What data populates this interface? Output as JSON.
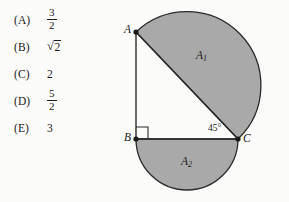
{
  "background_color": "#fbfbfa",
  "ink_color": "#1a1a1a",
  "shade_color": "#a9a9a9",
  "choices": [
    {
      "tag": "(A)",
      "kind": "fraction",
      "numerator": "3",
      "denominator": "2",
      "text": "3/2"
    },
    {
      "tag": "(B)",
      "kind": "radical",
      "radicand": "2",
      "text": "√2"
    },
    {
      "tag": "(C)",
      "kind": "plain",
      "value": "2",
      "text": "2"
    },
    {
      "tag": "(D)",
      "kind": "fraction",
      "numerator": "5",
      "denominator": "2",
      "text": "5/2"
    },
    {
      "tag": "(E)",
      "kind": "plain",
      "value": "3",
      "text": "3"
    }
  ],
  "figure": {
    "vertices": [
      {
        "name": "A",
        "label": "A",
        "x": 32,
        "y": 32
      },
      {
        "name": "B",
        "label": "B",
        "x": 32,
        "y": 139
      },
      {
        "name": "C",
        "label": "C",
        "x": 134,
        "y": 139
      }
    ],
    "regions": [
      {
        "name": "A1",
        "label": "A",
        "subscript": "1",
        "description": "semicircle on hypotenuse AC",
        "label_x": 92,
        "label_y": 49
      },
      {
        "name": "A2",
        "label": "A",
        "subscript": "2",
        "description": "semicircle on leg BC",
        "label_x": 77,
        "label_y": 155
      }
    ],
    "angles": [
      {
        "at": "C",
        "label": "45°",
        "label_x": 104,
        "label_y": 123
      },
      {
        "at": "B",
        "label": "right-angle-mark",
        "label_x": 0,
        "label_y": 0
      }
    ]
  }
}
